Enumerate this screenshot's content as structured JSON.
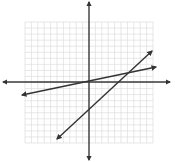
{
  "diagram": {
    "type": "coordinate-plane",
    "grid": {
      "columns": 20,
      "rows": 20,
      "left": 25,
      "top": 22,
      "right": 153,
      "bottom": 143,
      "color": "#d6d6d6"
    },
    "axes": {
      "x_axis_y": 82,
      "y_axis_x": 89,
      "x_from": 3,
      "x_to": 170,
      "y_from": 2,
      "y_to": 160,
      "color": "#3a3a3a"
    },
    "lines": [
      {
        "name": "line-shallow",
        "x1": 22,
        "y1": 95,
        "x2": 156,
        "y2": 67,
        "color": "#333333"
      },
      {
        "name": "line-steep",
        "x1": 57,
        "y1": 139,
        "x2": 152,
        "y2": 51,
        "color": "#333333"
      }
    ]
  }
}
